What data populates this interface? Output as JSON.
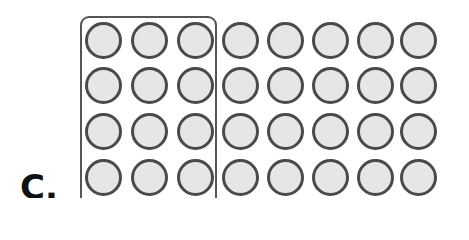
{
  "label": "C.",
  "grid": {
    "rows": 4,
    "cols": 8,
    "total_circles": 32,
    "grouped_columns": 3,
    "grouped_circles": 12,
    "col_centers": [
      103,
      149,
      195,
      240,
      285,
      330,
      375,
      418
    ],
    "row_centers": [
      40,
      85,
      131,
      177
    ]
  },
  "colors": {
    "circle_fill": "#e6e6e6",
    "circle_stroke": "#4a4a4a",
    "box_stroke": "#555555"
  }
}
